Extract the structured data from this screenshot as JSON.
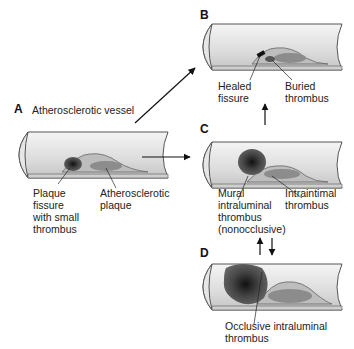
{
  "panels": {
    "A": {
      "letter": "A",
      "title": "Atherosclerotic vessel",
      "labels": {
        "fissure": "Plaque\nfissure\nwith small\nthrombus",
        "plaque": "Atherosclerotic\nplaque"
      }
    },
    "B": {
      "letter": "B",
      "labels": {
        "healed": "Healed\nfissure",
        "buried": "Buried\nthrombus"
      }
    },
    "C": {
      "letter": "C",
      "labels": {
        "mural": "Mural\nintraluminal\nthrombus\n(nonocclusive)",
        "intraintimal": "Intraintimal\nthrombus"
      }
    },
    "D": {
      "letter": "D",
      "labels": {
        "occlusive": "Occlusive intraluminal\nthrombus"
      }
    }
  },
  "colors": {
    "vessel_wall": "#d9d9d9",
    "vessel_outline": "#555555",
    "plaque": "#8c8c8c",
    "thrombus": "#3a3a3a",
    "arrow": "#111111"
  }
}
